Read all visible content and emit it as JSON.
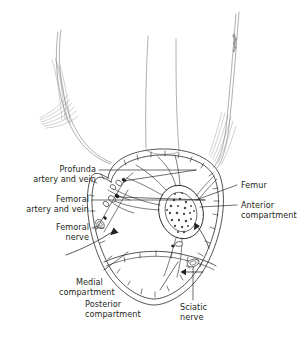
{
  "figure": {
    "line_color": "#231f20",
    "background": "#ffffff"
  },
  "labels": {
    "profunda": {
      "line1": "Profunda",
      "line2": "artery and vein"
    },
    "femoral_vessels": {
      "line1": "Femoral",
      "line2": "artery and vein"
    },
    "femoral_nerve": {
      "line1": "Femoral",
      "line2": "nerve"
    },
    "femur": {
      "line1": "Femur"
    },
    "anterior": {
      "line1": "Anterior",
      "line2": "compartment"
    },
    "medial": {
      "line1": "Medial",
      "line2": "compartment"
    },
    "posterior": {
      "line1": "Posterior",
      "line2": "compartment"
    },
    "sciatic": {
      "line1": "Sciatic",
      "line2": "nerve"
    }
  },
  "structures": {
    "femur_name": "femur",
    "fascia_lata_name": "fascia-lata",
    "anterior_compartment_name": "anterior-compartment",
    "medial_compartment_name": "medial-compartment",
    "posterior_compartment_name": "posterior-compartment"
  }
}
